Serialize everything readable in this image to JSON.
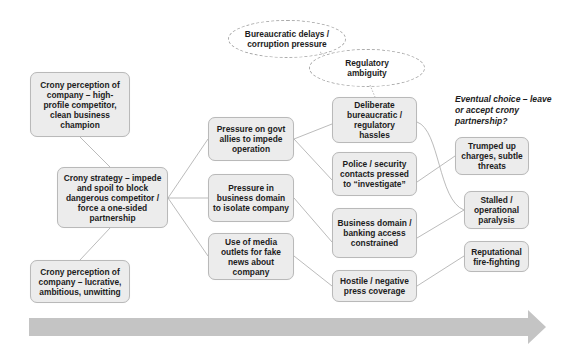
{
  "diagram": {
    "colors": {
      "box_fill": "#ececec",
      "box_border": "#b9b9b9",
      "connector": "#a9a9a9",
      "arrow": "#c4c4c4",
      "text": "#1c1c1c"
    },
    "perception_high_profile": "Crony perception of company – high-profile competitor, clean business champion",
    "crony_strategy": "Crony strategy – impede and spoil to block dangerous competitor / force a one-sided partnership",
    "perception_lucrative": "Crony perception of company – lucrative, ambitious, unwitting",
    "tactics": [
      {
        "label": "Pressure on govt allies to impede operation"
      },
      {
        "label": "Pressure in business domain to isolate company"
      },
      {
        "label": "Use of media outlets for fake news about company"
      }
    ],
    "effects": [
      {
        "label": "Deliberate bureaucratic / regulatory hassles"
      },
      {
        "label": "Police / security contacts pressed to “investigate”"
      },
      {
        "label": "Business domain / banking access constrained"
      },
      {
        "label": "Hostile / negative press coverage"
      }
    ],
    "outcomes": [
      {
        "label": "Trumped up charges, subtle threats"
      },
      {
        "label": "Stalled / operational paralysis"
      },
      {
        "label": "Reputational fire-fighting"
      }
    ],
    "clouds": [
      {
        "label": "Bureaucratic delays / corruption pressure"
      },
      {
        "label": "Regulatory ambiguity"
      }
    ],
    "eventual_choice": "Eventual choice – leave or accept crony partnership?",
    "timeline_arrow": "progression-arrow"
  }
}
